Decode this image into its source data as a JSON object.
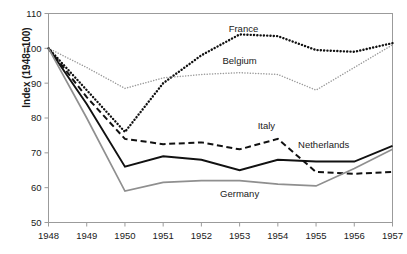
{
  "chart_data": {
    "type": "line",
    "title": "",
    "xlabel": "",
    "ylabel": "Index  (1948=100)",
    "x": [
      1948,
      1949,
      1950,
      1951,
      1952,
      1953,
      1954,
      1955,
      1956,
      1957
    ],
    "xticklabels": [
      "1948",
      "1949",
      "1950",
      "1951",
      "1952",
      "1953",
      "1954",
      "1955",
      "1956",
      "1957"
    ],
    "yticklabels": [
      "110",
      "100",
      "90",
      "80",
      "70",
      "60",
      "50"
    ],
    "yticks": [
      110,
      100,
      90,
      80,
      70,
      60,
      50
    ],
    "ylim": [
      50,
      110
    ],
    "xlim": [
      1948,
      1957
    ],
    "grid": false,
    "legend_position": "inline-annotations",
    "series": [
      {
        "name": "France",
        "style": "dotted-heavy",
        "color": "#111111",
        "label_x": 1953.1,
        "label_y": 104.8,
        "values": [
          100,
          88,
          76,
          90,
          98,
          104,
          103.5,
          99.5,
          99,
          101.5
        ]
      },
      {
        "name": "Belgium",
        "style": "dotted-light",
        "color": "#9a9a9a",
        "label_x": 1953.0,
        "label_y": 95.4,
        "values": [
          100,
          94.5,
          88.5,
          91.5,
          92.5,
          93,
          92.5,
          88,
          94.5,
          101
        ]
      },
      {
        "name": "Italy",
        "style": "dashed",
        "color": "#111111",
        "label_x": 1953.7,
        "label_y": 76.8,
        "values": [
          100,
          86,
          74,
          72.5,
          73,
          71,
          74,
          64.5,
          64,
          64.5
        ]
      },
      {
        "name": "Netherlands",
        "style": "solid",
        "color": "#111111",
        "label_x": 1955.2,
        "label_y": 71.3,
        "values": [
          100,
          84,
          66,
          69,
          68,
          65,
          68,
          67.5,
          67.5,
          72
        ]
      },
      {
        "name": "Germany",
        "style": "solid-gray",
        "color": "#8f8f8f",
        "label_x": 1953.0,
        "label_y": 57.2,
        "values": [
          100,
          80,
          59,
          61.5,
          62,
          62,
          61,
          60.5,
          65.5,
          71
        ]
      }
    ]
  },
  "axis": {
    "y_axis_title": "Index  (1948=100)"
  }
}
